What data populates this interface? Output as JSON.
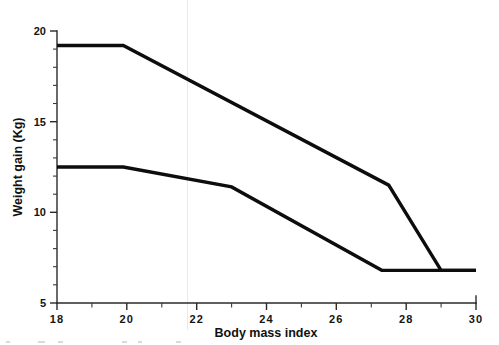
{
  "chart_data": {
    "type": "line",
    "title": "",
    "subtitle": "",
    "xlabel": "Body mass index",
    "ylabel": "Weight gain (Kg)",
    "xlim": [
      18,
      30
    ],
    "ylim": [
      5,
      20
    ],
    "xticks": [
      18,
      20,
      22,
      24,
      26,
      28,
      30
    ],
    "xtick_labels": [
      "18",
      "20",
      "22",
      "24",
      "26",
      "28",
      "30"
    ],
    "xminor_ticks": [
      19,
      21,
      23,
      25,
      27,
      29
    ],
    "yticks": [
      5,
      10,
      15,
      20
    ],
    "ytick_labels": [
      "5",
      "10",
      "15",
      "20"
    ],
    "yminor_ticks": [
      6,
      7,
      8,
      9,
      11,
      12,
      13,
      14,
      16,
      17,
      18,
      19
    ],
    "grid": false,
    "legend": null,
    "legend_position": "none",
    "line_color": "#0d0d0d",
    "axis_color": "#2a2a2a",
    "background_color": "#ffffff",
    "series": [
      {
        "name": "upper-recommendation-band",
        "x": [
          18.0,
          19.9,
          27.5,
          29.0,
          30.0
        ],
        "values": [
          19.2,
          19.2,
          11.5,
          6.8,
          6.8
        ]
      },
      {
        "name": "lower-recommendation-band",
        "x": [
          18.0,
          19.9,
          23.0,
          27.3,
          30.0
        ],
        "values": [
          12.5,
          12.5,
          11.4,
          6.8,
          6.8
        ]
      }
    ]
  },
  "axis": {
    "x_title": "Body mass index",
    "y_title": "Weight gain (Kg)"
  }
}
